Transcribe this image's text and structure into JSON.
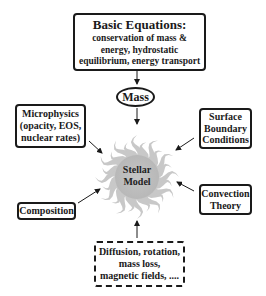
{
  "diagram": {
    "top_box": {
      "title": "Basic Equations:",
      "lines": [
        "conservation of mass &",
        "energy, hydrostatic",
        "equilibrium, energy transport"
      ]
    },
    "mass": "Mass",
    "center": {
      "lines": [
        "Stellar",
        "Model"
      ]
    },
    "microphysics": {
      "lines": [
        "Microphysics",
        "(opacity, EOS,",
        "nuclear rates)"
      ]
    },
    "surface": {
      "lines": [
        "Surface",
        "Boundary",
        "Conditions"
      ]
    },
    "convection": {
      "lines": [
        "Convection",
        "Theory"
      ]
    },
    "composition": {
      "lines": [
        "Composition"
      ]
    },
    "extras": {
      "lines": [
        "Diffusion, rotation,",
        "mass loss,",
        "magnetic fields, ...."
      ]
    },
    "colors": {
      "ink": "#1a1a1a",
      "star_rays": "#c8c8c8",
      "star_core": "#bdbdbd"
    }
  }
}
